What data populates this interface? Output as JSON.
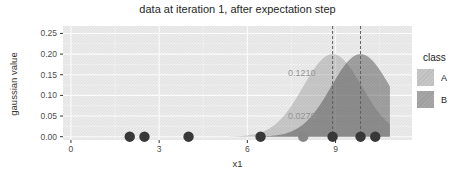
{
  "figure": {
    "title": "data at iteration 1, after expectation step",
    "x_axis_label": "x1",
    "y_axis_label": "gaussian value",
    "legend": {
      "title": "class",
      "items": [
        {
          "label": "A",
          "swatch": "#c6c6c6"
        },
        {
          "label": "B",
          "swatch": "#a6a6a6"
        }
      ]
    }
  },
  "chart_data": {
    "type": "area",
    "title": "data at iteration 1, after expectation step",
    "xlabel": "x1",
    "ylabel": "gaussian value",
    "xlim": [
      -0.27,
      11.6
    ],
    "ylim": [
      -0.008,
      0.268
    ],
    "x_ticks": [
      0,
      3,
      6,
      9
    ],
    "x_minor_ticks": [
      1.5,
      4.5,
      7.5,
      10.5
    ],
    "y_ticks": [
      0.0,
      0.05,
      0.1,
      0.15,
      0.2,
      0.25
    ],
    "grid": true,
    "legend_position": "right",
    "panel_bg": "#ebebeb",
    "series": [
      {
        "name": "A",
        "shape": "gaussian",
        "mean": 8.9,
        "sd": 1.0,
        "peak": 0.2,
        "x_start": 5.4,
        "x_end": 10.85,
        "fill": "rgba(150,150,150,0.42)"
      },
      {
        "name": "B",
        "shape": "gaussian",
        "mean": 9.85,
        "sd": 1.0,
        "peak": 0.2,
        "x_start": 6.4,
        "x_end": 10.85,
        "fill": "rgba(70,70,70,0.46)"
      }
    ],
    "mean_lines": {
      "x": [
        8.9,
        9.85
      ],
      "color": "#606060"
    },
    "points": {
      "y": 0,
      "x": [
        2.0,
        2.5,
        4.0,
        6.45,
        7.9,
        8.9,
        9.85,
        10.35
      ],
      "colors": [
        "#383838",
        "#383838",
        "#383838",
        "#383838",
        "#878787",
        "#383838",
        "#383838",
        "#383838"
      ],
      "radius": 5.2
    },
    "annotations": [
      {
        "text": "0.1210",
        "x": 7.85,
        "y": 0.155
      },
      {
        "text": "0.0270",
        "x": 7.85,
        "y": 0.05
      }
    ],
    "annotation_color": "#949494",
    "tick_label_color": "#4d4d4d",
    "tick_mark_color": "#333333",
    "major_grid_color": "#ffffff",
    "minor_grid_color": "rgba(255,255,255,0.55)"
  }
}
